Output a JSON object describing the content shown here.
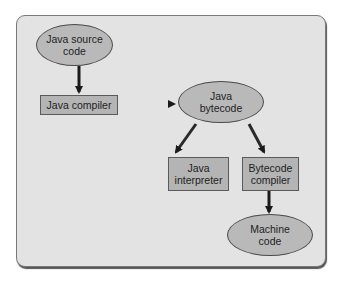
{
  "diagram": {
    "type": "flowchart",
    "title": "",
    "nodes": [
      {
        "id": "source",
        "shape": "ellipse",
        "label": "Java source code"
      },
      {
        "id": "compiler",
        "shape": "rectangle",
        "label": "Java compiler"
      },
      {
        "id": "bytecode",
        "shape": "ellipse",
        "label": "Java bytecode"
      },
      {
        "id": "interpreter",
        "shape": "rectangle",
        "label": "Java interpreter"
      },
      {
        "id": "bytecode_compiler",
        "shape": "rectangle",
        "label": "Bytecode compiler"
      },
      {
        "id": "machine",
        "shape": "ellipse",
        "label": "Machine code"
      }
    ],
    "edges": [
      {
        "from": "source",
        "to": "compiler"
      },
      {
        "from": "compiler",
        "to": "bytecode"
      },
      {
        "from": "bytecode",
        "to": "interpreter"
      },
      {
        "from": "bytecode",
        "to": "bytecode_compiler"
      },
      {
        "from": "bytecode_compiler",
        "to": "machine"
      }
    ]
  },
  "labels": {
    "source_l1": "Java source",
    "source_l2": "code",
    "compiler": "Java compiler",
    "bytecode_l1": "Java",
    "bytecode_l2": "bytecode",
    "interpreter_l1": "Java",
    "interpreter_l2": "interpreter",
    "bcompiler_l1": "Bytecode",
    "bcompiler_l2": "compiler",
    "machine_l1": "Machine",
    "machine_l2": "code"
  },
  "colors": {
    "panel": "#e3e3e3",
    "node_fill": "#b9b9b9",
    "arrow": "#1a1a1a"
  }
}
